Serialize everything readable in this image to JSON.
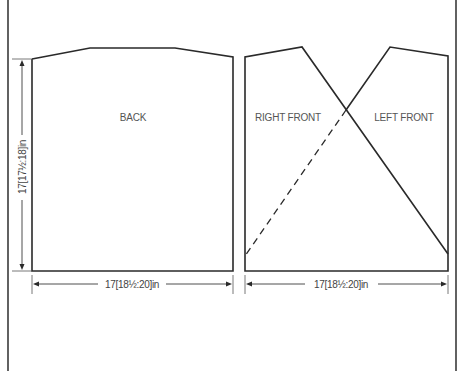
{
  "diagram": {
    "type": "knitting-schematic",
    "pieces": [
      {
        "id": "back",
        "label": "BACK"
      },
      {
        "id": "right-front",
        "label": "RIGHT FRONT"
      },
      {
        "id": "left-front",
        "label": "LEFT FRONT"
      }
    ],
    "dimensions": {
      "back_length": "17[17½:18]in",
      "back_width": "17[18½:20]in",
      "front_width": "17[18½:20]in"
    },
    "colors": {
      "line": "#2a2a2a",
      "text": "#555555",
      "background": "#ffffff"
    }
  }
}
